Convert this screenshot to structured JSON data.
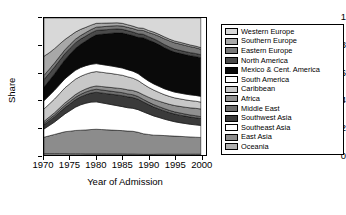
{
  "chart_data": {
    "type": "area",
    "title": "",
    "xlabel": "Year of Admission",
    "ylabel": "Share",
    "xlim": [
      1970,
      2001
    ],
    "ylim": [
      0,
      1
    ],
    "grid": false,
    "stacked": true,
    "normalized": true,
    "legend_position": "right",
    "xticks": [
      "1970",
      "1975",
      "1980",
      "1985",
      "1990",
      "1995",
      "2000"
    ],
    "xtick_values": [
      1970,
      1975,
      1980,
      1985,
      1990,
      1995,
      2000
    ],
    "yticks": [
      "0",
      "0.2",
      "0.4",
      "0.6",
      "0.8",
      "1"
    ],
    "ytick_values": [
      0,
      0.2,
      0.4,
      0.6,
      0.8,
      1
    ],
    "x": [
      1970,
      1971,
      1972,
      1973,
      1974,
      1975,
      1976,
      1977,
      1978,
      1979,
      1980,
      1981,
      1982,
      1983,
      1984,
      1985,
      1986,
      1987,
      1988,
      1989,
      1990,
      1991,
      1992,
      1993,
      1994,
      1995,
      1996,
      1997,
      1998,
      1999,
      2000
    ],
    "series": [
      {
        "name": "Oceania",
        "color": "#b0b0b0",
        "stack_order": 1,
        "values": [
          0.01,
          0.01,
          0.01,
          0.01,
          0.01,
          0.009,
          0.009,
          0.009,
          0.008,
          0.008,
          0.008,
          0.008,
          0.008,
          0.008,
          0.008,
          0.008,
          0.007,
          0.007,
          0.006,
          0.005,
          0.005,
          0.005,
          0.006,
          0.006,
          0.006,
          0.006,
          0.006,
          0.006,
          0.006,
          0.006,
          0.006
        ]
      },
      {
        "name": "East Asia",
        "color": "#8c8c8c",
        "stack_order": 2,
        "values": [
          0.12,
          0.13,
          0.14,
          0.15,
          0.16,
          0.165,
          0.17,
          0.172,
          0.175,
          0.178,
          0.18,
          0.178,
          0.176,
          0.174,
          0.172,
          0.17,
          0.168,
          0.166,
          0.16,
          0.15,
          0.145,
          0.14,
          0.138,
          0.136,
          0.134,
          0.132,
          0.13,
          0.128,
          0.126,
          0.124,
          0.122
        ]
      },
      {
        "name": "Southeast Asia",
        "color": "#ffffff",
        "stack_order": 3,
        "values": [
          0.06,
          0.075,
          0.09,
          0.11,
          0.13,
          0.15,
          0.17,
          0.185,
          0.195,
          0.2,
          0.2,
          0.195,
          0.19,
          0.185,
          0.18,
          0.175,
          0.17,
          0.168,
          0.165,
          0.16,
          0.15,
          0.14,
          0.13,
          0.12,
          0.112,
          0.105,
          0.1,
          0.096,
          0.092,
          0.09,
          0.088
        ]
      },
      {
        "name": "Southwest Asia",
        "color": "#3a3a3a",
        "stack_order": 4,
        "values": [
          0.03,
          0.034,
          0.038,
          0.042,
          0.046,
          0.05,
          0.054,
          0.058,
          0.062,
          0.066,
          0.07,
          0.072,
          0.074,
          0.076,
          0.078,
          0.08,
          0.08,
          0.078,
          0.076,
          0.072,
          0.068,
          0.065,
          0.062,
          0.06,
          0.058,
          0.056,
          0.055,
          0.054,
          0.053,
          0.052,
          0.05
        ]
      },
      {
        "name": "Middle East",
        "color": "#6e6e6e",
        "stack_order": 5,
        "values": [
          0.012,
          0.013,
          0.014,
          0.015,
          0.016,
          0.017,
          0.018,
          0.019,
          0.02,
          0.021,
          0.022,
          0.022,
          0.022,
          0.022,
          0.022,
          0.022,
          0.021,
          0.021,
          0.02,
          0.019,
          0.018,
          0.018,
          0.017,
          0.017,
          0.016,
          0.016,
          0.016,
          0.015,
          0.015,
          0.015,
          0.014
        ]
      },
      {
        "name": "Africa",
        "color": "#909090",
        "stack_order": 6,
        "values": [
          0.014,
          0.015,
          0.016,
          0.017,
          0.018,
          0.019,
          0.02,
          0.021,
          0.022,
          0.023,
          0.024,
          0.025,
          0.026,
          0.027,
          0.028,
          0.029,
          0.03,
          0.031,
          0.032,
          0.034,
          0.036,
          0.038,
          0.04,
          0.042,
          0.044,
          0.046,
          0.048,
          0.05,
          0.052,
          0.054,
          0.056
        ]
      },
      {
        "name": "Caribbean",
        "color": "#c8c8c8",
        "stack_order": 7,
        "values": [
          0.09,
          0.095,
          0.1,
          0.105,
          0.11,
          0.112,
          0.112,
          0.11,
          0.108,
          0.106,
          0.105,
          0.104,
          0.103,
          0.102,
          0.1,
          0.098,
          0.095,
          0.09,
          0.085,
          0.078,
          0.072,
          0.068,
          0.064,
          0.06,
          0.058,
          0.056,
          0.055,
          0.054,
          0.053,
          0.052,
          0.05
        ]
      },
      {
        "name": "South America",
        "color": "#ffffff",
        "stack_order": 8,
        "values": [
          0.06,
          0.062,
          0.064,
          0.065,
          0.066,
          0.066,
          0.065,
          0.064,
          0.062,
          0.06,
          0.058,
          0.057,
          0.056,
          0.055,
          0.054,
          0.053,
          0.052,
          0.051,
          0.05,
          0.048,
          0.046,
          0.045,
          0.044,
          0.043,
          0.043,
          0.042,
          0.042,
          0.042,
          0.042,
          0.042,
          0.042
        ]
      },
      {
        "name": "Mexico & Cent. America",
        "color": "#0a0a0a",
        "stack_order": 9,
        "values": [
          0.1,
          0.11,
          0.12,
          0.13,
          0.14,
          0.15,
          0.16,
          0.17,
          0.18,
          0.195,
          0.21,
          0.22,
          0.23,
          0.24,
          0.25,
          0.255,
          0.258,
          0.26,
          0.265,
          0.29,
          0.3,
          0.305,
          0.305,
          0.3,
          0.296,
          0.292,
          0.29,
          0.288,
          0.286,
          0.284,
          0.282
        ]
      },
      {
        "name": "North America",
        "color": "#4a4a4a",
        "stack_order": 10,
        "values": [
          0.055,
          0.052,
          0.05,
          0.047,
          0.044,
          0.042,
          0.04,
          0.038,
          0.036,
          0.034,
          0.032,
          0.031,
          0.03,
          0.029,
          0.028,
          0.027,
          0.027,
          0.026,
          0.026,
          0.025,
          0.024,
          0.024,
          0.023,
          0.023,
          0.022,
          0.022,
          0.022,
          0.022,
          0.022,
          0.022,
          0.022
        ]
      },
      {
        "name": "Eastern Europe",
        "color": "#787878",
        "stack_order": 11,
        "values": [
          0.03,
          0.03,
          0.029,
          0.029,
          0.028,
          0.028,
          0.027,
          0.026,
          0.026,
          0.025,
          0.024,
          0.024,
          0.024,
          0.024,
          0.024,
          0.024,
          0.024,
          0.025,
          0.026,
          0.028,
          0.03,
          0.034,
          0.038,
          0.042,
          0.044,
          0.046,
          0.046,
          0.045,
          0.044,
          0.042,
          0.04
        ]
      },
      {
        "name": "Southern Europe",
        "color": "#a8a8a8",
        "stack_order": 12,
        "values": [
          0.14,
          0.12,
          0.105,
          0.09,
          0.075,
          0.062,
          0.052,
          0.045,
          0.038,
          0.032,
          0.028,
          0.026,
          0.024,
          0.022,
          0.021,
          0.02,
          0.019,
          0.018,
          0.017,
          0.016,
          0.015,
          0.015,
          0.014,
          0.014,
          0.013,
          0.013,
          0.013,
          0.013,
          0.012,
          0.012,
          0.012
        ]
      },
      {
        "name": "Western Europe",
        "color": "#d8d8d8",
        "stack_order": 13,
        "values": [
          0.279,
          0.254,
          0.224,
          0.19,
          0.156,
          0.13,
          0.103,
          0.083,
          0.068,
          0.052,
          0.039,
          0.038,
          0.037,
          0.036,
          0.035,
          0.039,
          0.049,
          0.059,
          0.072,
          0.075,
          0.091,
          0.103,
          0.119,
          0.137,
          0.154,
          0.168,
          0.177,
          0.187,
          0.197,
          0.205,
          0.216
        ]
      }
    ],
    "legend_entries": [
      {
        "label": "Western Europe",
        "color": "#d8d8d8"
      },
      {
        "label": "Southern Europe",
        "color": "#a8a8a8"
      },
      {
        "label": "Eastern Europe",
        "color": "#787878"
      },
      {
        "label": "North America",
        "color": "#4a4a4a"
      },
      {
        "label": "Mexico & Cent. America",
        "color": "#0a0a0a"
      },
      {
        "label": "South America",
        "color": "#ffffff"
      },
      {
        "label": "Caribbean",
        "color": "#c8c8c8"
      },
      {
        "label": "Africa",
        "color": "#909090"
      },
      {
        "label": "Middle East",
        "color": "#6e6e6e"
      },
      {
        "label": "Southwest Asia",
        "color": "#3a3a3a"
      },
      {
        "label": "Southeast Asia",
        "color": "#ffffff"
      },
      {
        "label": "East Asia",
        "color": "#8c8c8c"
      },
      {
        "label": "Oceania",
        "color": "#b0b0b0"
      }
    ]
  }
}
